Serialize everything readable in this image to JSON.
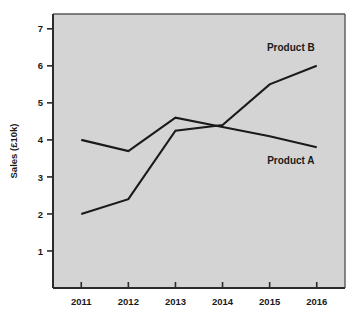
{
  "chart_data": {
    "type": "line",
    "title": "",
    "xlabel": "",
    "ylabel": "Sales (£10k)",
    "categories": [
      "2011",
      "2012",
      "2013",
      "2014",
      "2015",
      "2016"
    ],
    "x": [
      2011,
      2012,
      2013,
      2014,
      2015,
      2016
    ],
    "xlim": [
      2010.4,
      2016.6
    ],
    "ylim": [
      0,
      7.4
    ],
    "yticks": [
      1,
      2,
      3,
      4,
      5,
      6,
      7
    ],
    "ytick_labels": [
      "1",
      "2",
      "3",
      "4",
      "5",
      "6",
      "7"
    ],
    "xtick_labels": [
      "2011",
      "2012",
      "2013",
      "2014",
      "2015",
      "2016"
    ],
    "grid": false,
    "legend": "inline-annotations",
    "plot_background": "#d4d4d4",
    "line_color": "#1a1a1a",
    "series": [
      {
        "name": "Product A",
        "values": [
          4.0,
          3.7,
          4.6,
          4.35,
          4.1,
          3.8
        ],
        "label": "Product A",
        "label_position": "right-below"
      },
      {
        "name": "Product B",
        "values": [
          2.0,
          2.4,
          4.25,
          4.4,
          5.5,
          6.0
        ],
        "label": "Product B",
        "label_position": "right-above"
      }
    ],
    "annotations": [
      {
        "text": "Product B",
        "x": 2015.45,
        "y": 6.4
      },
      {
        "text": "Product A",
        "x": 2015.45,
        "y": 3.35
      }
    ]
  },
  "labels": {
    "y_axis_title": "Sales (£10k)",
    "series_a": "Product A",
    "series_b": "Product B"
  }
}
